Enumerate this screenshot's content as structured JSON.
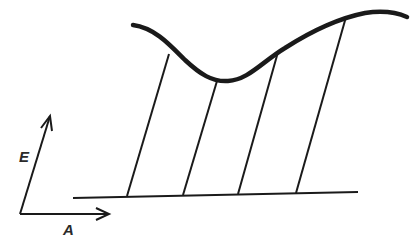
{
  "diagram": {
    "axes": {
      "vertical_label": "E",
      "horizontal_label": "A"
    },
    "curve": {
      "description": "wavy upper surface curve",
      "points": [
        [
          133,
          25
        ],
        [
          169,
          53
        ],
        [
          217,
          81
        ],
        [
          230,
          81
        ],
        [
          278,
          52
        ],
        [
          346,
          17
        ],
        [
          380,
          13
        ],
        [
          407,
          17
        ]
      ]
    },
    "baseline": {
      "start": [
        73,
        198
      ],
      "end": [
        358,
        192
      ]
    },
    "connector_lines": [
      {
        "top": [
          169,
          53
        ],
        "bottom": [
          127,
          195
        ]
      },
      {
        "top": [
          217,
          81
        ],
        "bottom": [
          183,
          194
        ]
      },
      {
        "top": [
          278,
          52
        ],
        "bottom": [
          238,
          193
        ]
      },
      {
        "top": [
          346,
          17
        ],
        "bottom": [
          296,
          192
        ]
      }
    ],
    "stroke_color": "#1a1a1a"
  }
}
